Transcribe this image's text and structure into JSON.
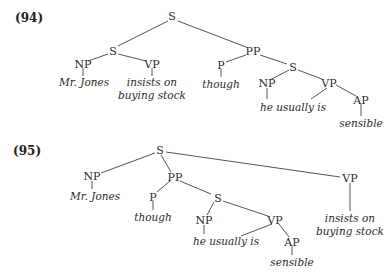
{
  "diagrams": [
    {
      "number": "(94)",
      "nodes": {
        "s_root": "S",
        "s_left": "S",
        "np1": "NP",
        "np1_word": "Mr. Jones",
        "vp1": "VP",
        "vp1_word_line1": "insists on",
        "vp1_word_line2": "buying stock",
        "pp": "PP",
        "p": "P",
        "p_word": "though",
        "s_inner": "S",
        "np2": "NP",
        "np2_word": "he usually is",
        "vp2": "VP",
        "ap": "AP",
        "ap_word": "sensible"
      }
    },
    {
      "number": "(95)",
      "nodes": {
        "s_root": "S",
        "np1": "NP",
        "np1_word": "Mr. Jones",
        "pp": "PP",
        "p": "P",
        "p_word": "though",
        "s_inner": "S",
        "np2": "NP",
        "np2_word": "he usually is",
        "vp2": "VP",
        "ap": "AP",
        "ap_word": "sensible",
        "vp1": "VP",
        "vp1_word_line1": "insists on",
        "vp1_word_line2": "buying stock"
      }
    }
  ]
}
